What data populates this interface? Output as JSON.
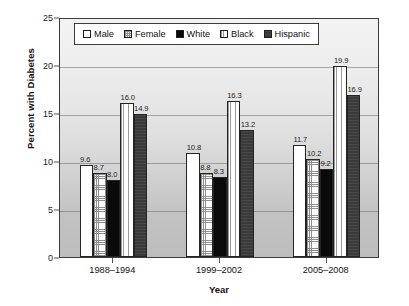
{
  "chart_data": {
    "type": "bar",
    "title": "",
    "xlabel": "Year",
    "ylabel": "Percent with Diabetes",
    "categories": [
      "1988–1994",
      "1999–2002",
      "2005–2008"
    ],
    "ylim": [
      0,
      25
    ],
    "yticks": [
      0,
      5,
      10,
      15,
      20,
      25
    ],
    "ytick_labels": [
      "0",
      "5",
      "10",
      "15",
      "20",
      "25"
    ],
    "grid": true,
    "grid_axis": "y",
    "legend_position": "top-center",
    "series": [
      {
        "name": "Male",
        "pattern": "solid-white",
        "values": [
          9.6,
          10.8,
          11.7
        ],
        "labels": [
          "9.6",
          "10.8",
          "11.7"
        ]
      },
      {
        "name": "Female",
        "pattern": "cross-hatch",
        "values": [
          8.7,
          8.8,
          10.2
        ],
        "labels": [
          "8.7",
          "8.8",
          "10.2"
        ]
      },
      {
        "name": "White",
        "pattern": "solid-black",
        "values": [
          8.0,
          8.3,
          9.2
        ],
        "labels": [
          "8.0",
          "8.3",
          "9.2"
        ]
      },
      {
        "name": "Black",
        "pattern": "vertical-lines",
        "values": [
          16.0,
          16.3,
          19.9
        ],
        "labels": [
          "16.0",
          "16.3",
          "19.9"
        ]
      },
      {
        "name": "Hispanic",
        "pattern": "solid-dark-gray",
        "values": [
          14.9,
          13.2,
          16.9
        ],
        "labels": [
          "14.9",
          "13.2",
          "16.9"
        ]
      }
    ]
  },
  "colors": {
    "male": "#ffffff",
    "female": "#fbfbfb",
    "white": "#0a0a0a",
    "black": "#ffffff",
    "hispanic": "#3a3a3a",
    "axis": "#3d3d3d",
    "text": "#111111",
    "gridline": "#6e6e6e"
  }
}
